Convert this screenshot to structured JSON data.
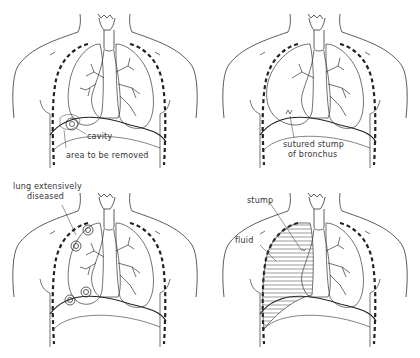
{
  "diagram": {
    "type": "medical-illustration",
    "stroke_color": "#333333",
    "background": "#ffffff",
    "panels": [
      {
        "id": "top-left",
        "labels": {
          "cavity": "cavity",
          "area": "area to be removed"
        }
      },
      {
        "id": "top-right",
        "labels": {
          "stump_line1": "sutured stump",
          "stump_line2": "of bronchus"
        }
      },
      {
        "id": "bottom-left",
        "labels": {
          "diseased_line1": "lung extensively",
          "diseased_line2": "diseased"
        }
      },
      {
        "id": "bottom-right",
        "labels": {
          "stump": "stump",
          "fluid": "fluid"
        }
      }
    ]
  }
}
